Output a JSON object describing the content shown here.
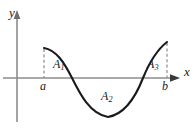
{
  "figure": {
    "background_color": "#ffffff",
    "axis_color": "#8c8c8c",
    "curve_color": "#1a1a1a",
    "dashed_color": "#8c8c8c",
    "label_color": "#1a1a1a",
    "axes": {
      "y_label": "y",
      "x_label": "x",
      "origin": {
        "x": 17,
        "y": 78
      },
      "x_axis": {
        "x_start": 3,
        "x_end": 178,
        "y": 78,
        "arrow": "right"
      },
      "y_axis": {
        "y_start": 122,
        "y_end": 12,
        "x": 17,
        "arrow": "up"
      }
    },
    "tick_labels": [
      {
        "name": "lower-limit",
        "text": "a",
        "x": 44
      },
      {
        "name": "upper-limit",
        "text": "b",
        "x": 167
      }
    ],
    "regions": [
      {
        "name": "region-a1",
        "letter": "A",
        "subscript": "1",
        "position": "above-axis",
        "sign": "positive"
      },
      {
        "name": "region-a2",
        "letter": "A",
        "subscript": "2",
        "position": "below-axis",
        "sign": "negative"
      },
      {
        "name": "region-a3",
        "letter": "A",
        "subscript": "3",
        "position": "above-axis",
        "sign": "positive"
      }
    ],
    "curve": {
      "description": "smooth curve starting above axis at x=a, descending through a root, reaching a minimum below the axis, then rising through a second root to a maximum at x=b",
      "start_point": {
        "x": 44,
        "y": 48
      },
      "end_point": {
        "x": 167,
        "y": 42
      },
      "roots": [
        {
          "x": 72,
          "y": 78
        },
        {
          "x": 143,
          "y": 78
        }
      ],
      "minimum": {
        "x": 108,
        "y": 117
      }
    },
    "dashed_lines": [
      {
        "name": "dashed-at-a",
        "x": 44,
        "y_top": 48,
        "y_bottom": 78
      },
      {
        "name": "dashed-at-b",
        "x": 167,
        "y_top": 42,
        "y_bottom": 78
      }
    ]
  }
}
